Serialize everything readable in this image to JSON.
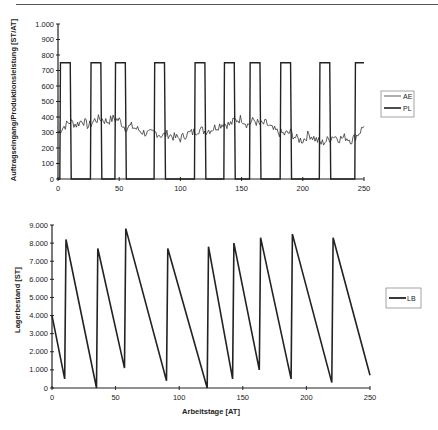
{
  "chart_data": [
    {
      "type": "line",
      "title": "",
      "xlabel": "Arbeitstage [AT]",
      "ylabel": "Auftragseingang/Produktionsleistung [ST/AT]",
      "xlim": [
        0,
        250
      ],
      "ylim": [
        0,
        1000
      ],
      "xticks": [
        "0",
        "50",
        "100",
        "150",
        "200",
        "250"
      ],
      "yticks": [
        "0",
        "100",
        "200",
        "300",
        "400",
        "500",
        "600",
        "700",
        "800",
        "900",
        "1.000"
      ],
      "grid": false,
      "legend_position": "right",
      "series": [
        {
          "name": "AE",
          "description": "noisy demand fluctuating roughly 200-400",
          "x": [
            0,
            5,
            10,
            15,
            20,
            25,
            30,
            35,
            40,
            45,
            50,
            55,
            60,
            65,
            70,
            75,
            80,
            85,
            90,
            95,
            100,
            105,
            110,
            115,
            120,
            125,
            130,
            135,
            140,
            145,
            150,
            155,
            160,
            165,
            170,
            175,
            180,
            185,
            190,
            195,
            200,
            205,
            210,
            215,
            220,
            225,
            230,
            235,
            240,
            245,
            250
          ],
          "values": [
            300,
            340,
            370,
            350,
            380,
            340,
            380,
            390,
            370,
            390,
            380,
            330,
            340,
            320,
            300,
            290,
            300,
            280,
            290,
            270,
            260,
            290,
            300,
            320,
            310,
            320,
            340,
            360,
            350,
            380,
            390,
            350,
            380,
            350,
            360,
            320,
            300,
            290,
            300,
            260,
            250,
            290,
            260,
            230,
            250,
            280,
            260,
            270,
            250,
            290,
            340
          ]
        },
        {
          "name": "PL",
          "description": "production pulses at 750, otherwise 0",
          "level": 750,
          "pulses": [
            [
              2,
              10
            ],
            [
              27,
              35
            ],
            [
              47,
              55
            ],
            [
              79,
              87
            ],
            [
              112,
              120
            ],
            [
              136,
              144
            ],
            [
              157,
              165
            ],
            [
              182,
              190
            ],
            [
              214,
              222
            ],
            [
              243,
              250
            ]
          ]
        }
      ]
    },
    {
      "type": "line",
      "title": "",
      "xlabel": "Arbeitstage [AT]",
      "ylabel": "Lagerbestand [ST]",
      "xlim": [
        0,
        250
      ],
      "ylim": [
        0,
        9000
      ],
      "xticks": [
        "0",
        "50",
        "100",
        "150",
        "200",
        "250"
      ],
      "yticks": [
        "0",
        "1.000",
        "2.000",
        "3.000",
        "4.000",
        "5.000",
        "6.000",
        "7.000",
        "8.000",
        "9.000"
      ],
      "grid": false,
      "legend_position": "right",
      "series": [
        {
          "name": "LB",
          "x": [
            0,
            10,
            11,
            35,
            36,
            57,
            58,
            90,
            91,
            122,
            123,
            142,
            143,
            163,
            164,
            188,
            189,
            220,
            221,
            250
          ],
          "values": [
            4000,
            500,
            8200,
            0,
            7700,
            1100,
            8800,
            400,
            7700,
            0,
            7800,
            500,
            8000,
            1000,
            8300,
            500,
            8500,
            300,
            8300,
            700
          ]
        }
      ]
    }
  ],
  "chart1": {
    "ylabel": "Auftragseingang/Produktionsleistung [ST/AT]",
    "xlabel": "Arbeitstage [AT]",
    "legend": [
      "AE",
      "PL"
    ]
  },
  "chart2": {
    "ylabel": "Lagerbestand [ST]",
    "xlabel": "Arbeitstage [AT]",
    "legend": [
      "LB"
    ]
  }
}
